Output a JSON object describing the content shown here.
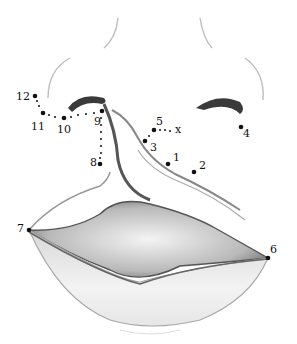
{
  "diagram": {
    "landmarks": [
      {
        "id": "p1",
        "label": "1",
        "dot": [
          168,
          164
        ],
        "text": [
          173,
          152
        ]
      },
      {
        "id": "p2",
        "label": "2",
        "dot": [
          194,
          172
        ],
        "text": [
          199,
          160
        ]
      },
      {
        "id": "p3",
        "label": "3",
        "dot": [
          145,
          141
        ],
        "text": [
          150,
          142
        ]
      },
      {
        "id": "p4",
        "label": "4",
        "dot": [
          241,
          127
        ],
        "text": [
          243,
          128
        ]
      },
      {
        "id": "p5",
        "label": "5",
        "dot": [
          154,
          130
        ],
        "text": [
          156,
          116
        ]
      },
      {
        "id": "px",
        "label": "x",
        "dot": [
          176,
          132
        ],
        "text": [
          175,
          124
        ]
      },
      {
        "id": "p6",
        "label": "6",
        "dot": [
          268,
          258
        ],
        "text": [
          270,
          244
        ]
      },
      {
        "id": "p7",
        "label": "7",
        "dot": [
          29,
          230
        ],
        "text": [
          17,
          223
        ]
      },
      {
        "id": "p8",
        "label": "8",
        "dot": [
          100,
          164
        ],
        "text": [
          90,
          157
        ]
      },
      {
        "id": "p9",
        "label": "9",
        "dot": [
          102,
          111
        ],
        "text": [
          94,
          116
        ]
      },
      {
        "id": "p10",
        "label": "10",
        "dot": [
          64,
          118
        ],
        "text": [
          57,
          124
        ]
      },
      {
        "id": "p11",
        "label": "11",
        "dot": [
          43,
          113
        ],
        "text": [
          31,
          121
        ]
      },
      {
        "id": "p12",
        "label": "12",
        "dot": [
          35,
          96
        ],
        "text": [
          16,
          91
        ]
      }
    ],
    "colors": {
      "ink": "#111111",
      "shade": "#8a8a8a",
      "light": "#cfcfcf"
    }
  }
}
